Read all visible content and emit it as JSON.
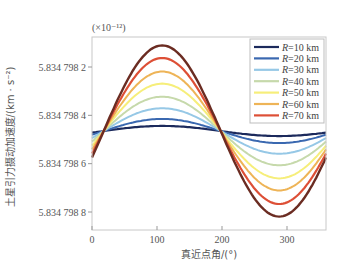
{
  "chart_data": {
    "type": "line",
    "title": "",
    "xlabel": "真近点角/(°)",
    "ylabel": "土星引力摄动加速度/(km · s⁻²)",
    "y_multiplier": "(×10⁻¹²)",
    "xlim": [
      0,
      360
    ],
    "ylim_inverted": true,
    "x_ticks": [
      0,
      100,
      200,
      300
    ],
    "x_tick_labels": [
      "0",
      "100",
      "200",
      "300"
    ],
    "y_ticks": [
      5.8347982,
      5.8347984,
      5.8347986,
      5.8347988
    ],
    "y_tick_labels": [
      "5.834 798 2",
      "5.834 798 4",
      "5.834 798 6",
      "5.834 798 8"
    ],
    "grid": false,
    "legend_position": "upper right",
    "legend": [
      "R=10 km",
      "R=20 km",
      "R=30 km",
      "R=40 km",
      "R=50 km",
      "R=60 km",
      "R=70 km"
    ],
    "series": [
      {
        "name": "R=10 km",
        "color": "#1c2a5c",
        "amplitude": 0.021,
        "width": 2.2
      },
      {
        "name": "R=20 km",
        "color": "#3a68b0",
        "amplitude": 0.05,
        "width": 2.0
      },
      {
        "name": "R=30 km",
        "color": "#96c8e6",
        "amplitude": 0.094,
        "width": 2.0
      },
      {
        "name": "R=40 km",
        "color": "#c6d9ab",
        "amplitude": 0.142,
        "width": 2.0
      },
      {
        "name": "R=50 km",
        "color": "#f6ee7a",
        "amplitude": 0.196,
        "width": 2.0
      },
      {
        "name": "R=60 km",
        "color": "#eeb457",
        "amplitude": 0.246,
        "width": 2.0
      },
      {
        "name": "R=70 km",
        "color": "#dd4f36",
        "amplitude": 0.302,
        "width": 2.2
      },
      {
        "name": "R=80 km",
        "color": "#6b2c22",
        "amplitude": 0.354,
        "width": 2.4
      }
    ],
    "curve_model": "y = 5.8347985 - A·sin(θ - 18°) (×10⁻¹²·k scale), peaks near 105°, troughs near 290°",
    "center_value": 5.83479853,
    "phase_deg": 18
  }
}
